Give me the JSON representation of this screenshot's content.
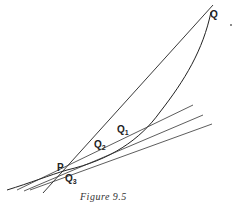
{
  "figure": {
    "caption": "Figure 9.5",
    "points": {
      "Q": {
        "label": "Q",
        "sub": ""
      },
      "P": {
        "label": "P",
        "sub": ""
      },
      "Q1": {
        "label": "Q",
        "sub": "1"
      },
      "Q2": {
        "label": "Q",
        "sub": "2"
      },
      "Q3": {
        "label": "Q",
        "sub": "3"
      }
    },
    "colors": {
      "line": "#222222",
      "background": "#ffffff"
    }
  }
}
